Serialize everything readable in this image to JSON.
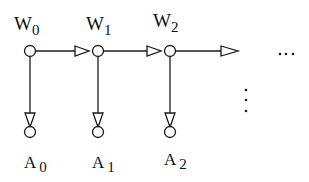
{
  "diagram": {
    "top_nodes": [
      {
        "label": "W",
        "sub": "0"
      },
      {
        "label": "W",
        "sub": "1"
      },
      {
        "label": "W",
        "sub": "2"
      }
    ],
    "bottom_nodes": [
      {
        "label": "A",
        "sub": "0"
      },
      {
        "label": "A",
        "sub": "1"
      },
      {
        "label": "A",
        "sub": "2"
      }
    ],
    "horizontal_ellipsis": "...",
    "vertical_ellipsis": "⋮",
    "colors": {
      "stroke": "#1a1a1a",
      "background": "#ffffff"
    }
  }
}
